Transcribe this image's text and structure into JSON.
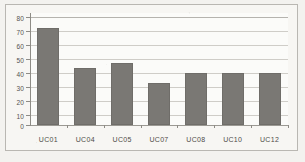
{
  "chart_data": {
    "type": "bar",
    "title": "",
    "subtitle": "",
    "xlabel": "",
    "ylabel": "",
    "categories": [
      "UC01",
      "UC04",
      "UC05",
      "UC07",
      "UC08",
      "UC10",
      "UC12"
    ],
    "values": [
      69,
      41,
      44.5,
      30,
      37,
      37,
      37.5
    ],
    "series": [
      {
        "name": "",
        "values": [
          69,
          41,
          44.5,
          30,
          37,
          37,
          37.5
        ]
      }
    ],
    "ylim": [
      0,
      80
    ],
    "ytick_labels": [
      "0",
      "10",
      "20",
      "30",
      "40",
      "50",
      "60",
      "70",
      "80"
    ],
    "ytick_values": [
      0,
      10,
      20,
      30,
      40,
      50,
      60,
      70,
      80
    ],
    "grid": "horizontal",
    "legend": "none",
    "bar_color": "#7a7874",
    "gridline_color": "#cfcdc8",
    "axis_color": "#8e8c86",
    "plot_background": "#fbfbf9",
    "figure_background": "#f3f2ef"
  }
}
